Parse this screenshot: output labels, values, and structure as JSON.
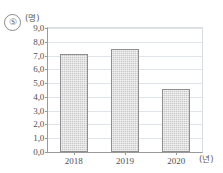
{
  "figure": {
    "item_marker": "⑤"
  },
  "chart_data": {
    "type": "bar",
    "title": "",
    "xlabel": "(년)",
    "ylabel": "(명)",
    "categories": [
      "2018",
      "2019",
      "2020"
    ],
    "values": [
      7.1,
      7.5,
      4.6
    ],
    "ylim": [
      0.0,
      9.0
    ],
    "ytick_labels": [
      "9,0",
      "8,0",
      "7,0",
      "6,0",
      "5,0",
      "4,0",
      "3,0",
      "2,0",
      "1,0",
      "0,0"
    ],
    "ytick_values": [
      9.0,
      8.0,
      7.0,
      6.0,
      5.0,
      4.0,
      3.0,
      2.0,
      1.0,
      0.0
    ],
    "grid": true,
    "legend": "none",
    "bar_color": "#c9c9c9",
    "bar_border_color": "#8e8e8e",
    "grid_color": "#dfe5ea",
    "axis_color": "#9a9a9a"
  }
}
